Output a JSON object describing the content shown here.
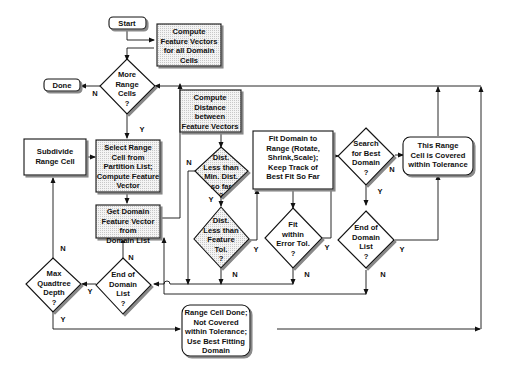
{
  "diagram": {
    "type": "flowchart",
    "nodes": {
      "start": {
        "shape": "terminal",
        "lines": [
          "Start"
        ]
      },
      "compute_fv": {
        "shape": "process-shaded",
        "lines": [
          "Compute",
          "Feature Vectors",
          "for all Domain",
          "Cells"
        ]
      },
      "more_range": {
        "shape": "decision",
        "lines": [
          "More",
          "Range",
          "Cells",
          "?"
        ]
      },
      "done": {
        "shape": "terminal",
        "lines": [
          "Done"
        ]
      },
      "compute_dist": {
        "shape": "process-shaded",
        "lines": [
          "Compute",
          "Distance",
          "between",
          "Feature Vectors"
        ]
      },
      "subdivide": {
        "shape": "process",
        "lines": [
          "Subdivide",
          "Range Cell"
        ]
      },
      "select_range": {
        "shape": "process-shaded",
        "lines": [
          "Select Range",
          "Cell from",
          "Partition List;",
          "Compute Feature",
          "Vector"
        ]
      },
      "get_domain": {
        "shape": "process-shaded",
        "lines": [
          "Get Domain",
          "Feature Vector",
          "from",
          "Domain List"
        ]
      },
      "dist_min": {
        "shape": "decision-shaded",
        "lines": [
          "Dist.",
          "Less than",
          "Min. Dist.",
          "so far",
          "?"
        ]
      },
      "dist_tol": {
        "shape": "decision-shaded",
        "lines": [
          "Dist.",
          "Less than",
          "Feature",
          "Tol.",
          "?"
        ]
      },
      "fit_domain": {
        "shape": "process",
        "lines": [
          "Fit Domain to",
          "Range (Rotate,",
          "Shrink,Scale);",
          "Keep Track of",
          "Best Fit So Far"
        ]
      },
      "fit_within": {
        "shape": "decision",
        "lines": [
          "Fit",
          "within",
          "Error Tol.",
          "?"
        ]
      },
      "search_best": {
        "shape": "decision",
        "lines": [
          "Search",
          "for Best",
          "Domain",
          "?"
        ]
      },
      "end_domain_right": {
        "shape": "decision",
        "lines": [
          "End of",
          "Domain",
          "List",
          "?"
        ]
      },
      "covered": {
        "shape": "terminal",
        "lines": [
          "This Range",
          "Cell is Covered",
          "within Tolerance"
        ]
      },
      "max_quad": {
        "shape": "decision",
        "lines": [
          "Max",
          "Quadtree",
          "Depth",
          "?"
        ]
      },
      "end_domain_left": {
        "shape": "decision",
        "lines": [
          "End of",
          "Domain",
          "List",
          "?"
        ]
      },
      "not_covered": {
        "shape": "terminal",
        "lines": [
          "Range Cell Done;",
          "Not Covered",
          "within Tolerance;",
          "Use Best Fitting",
          "Domain"
        ]
      }
    },
    "edge_labels": {
      "yes": "Y",
      "no": "N"
    }
  }
}
